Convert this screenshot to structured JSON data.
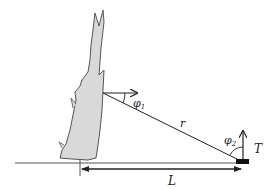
{
  "diagram": {
    "labels": {
      "phi1": "φ",
      "phi1_sub": "1",
      "phi2": "φ",
      "phi2_sub": "2",
      "r": "r",
      "T": "T",
      "L": "L"
    },
    "colors": {
      "tree_fill": "#d9d9d9",
      "tree_stroke": "#555555",
      "line": "#222222",
      "sensor": "#111111"
    }
  }
}
